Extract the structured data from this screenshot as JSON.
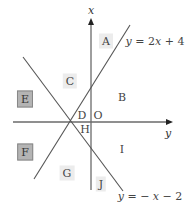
{
  "diagram": {
    "type": "coordinate-plane-regions",
    "axes": {
      "vertical": {
        "label": "x"
      },
      "horizontal": {
        "label": "y"
      },
      "origin_label": "O"
    },
    "lines": [
      {
        "name": "line-1",
        "equation": "y = 2x + 4",
        "eq_parts": [
          "y",
          " = 2",
          "x",
          " + 4"
        ]
      },
      {
        "name": "line-2",
        "equation": "y = − x − 2",
        "eq_parts": [
          "y",
          " = − ",
          "x",
          " − 2"
        ]
      }
    ],
    "regions": [
      {
        "id": "A",
        "style": "light"
      },
      {
        "id": "B",
        "style": "plain"
      },
      {
        "id": "C",
        "style": "light"
      },
      {
        "id": "D",
        "style": "plain"
      },
      {
        "id": "E",
        "style": "dark"
      },
      {
        "id": "F",
        "style": "dark"
      },
      {
        "id": "G",
        "style": "light"
      },
      {
        "id": "H",
        "style": "plain"
      },
      {
        "id": "I",
        "style": "plain"
      },
      {
        "id": "J",
        "style": "light"
      }
    ],
    "colors": {
      "line": "#555555",
      "axis": "#666666",
      "light_box": "#ececec",
      "dark_box": "#b4b4b4"
    }
  }
}
